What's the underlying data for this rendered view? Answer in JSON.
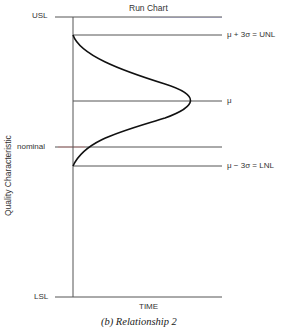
{
  "diagram": {
    "title": "Run Chart",
    "y_axis_label": "Quality Characteristic",
    "x_axis_label": "TIME",
    "caption": "(b)  Relationship 2",
    "left_labels": {
      "usl": "USL",
      "nominal": "nominal",
      "lsl": "LSL"
    },
    "right_labels": {
      "unl": "μ  +  3σ  =  UNL",
      "mu": "μ",
      "lnl": "μ  −  3σ  =  LNL"
    },
    "colors": {
      "line": "#444444",
      "curve": "#111111",
      "nominal_accent": "#c98080",
      "usl_accent": "#6b6ba8"
    }
  }
}
